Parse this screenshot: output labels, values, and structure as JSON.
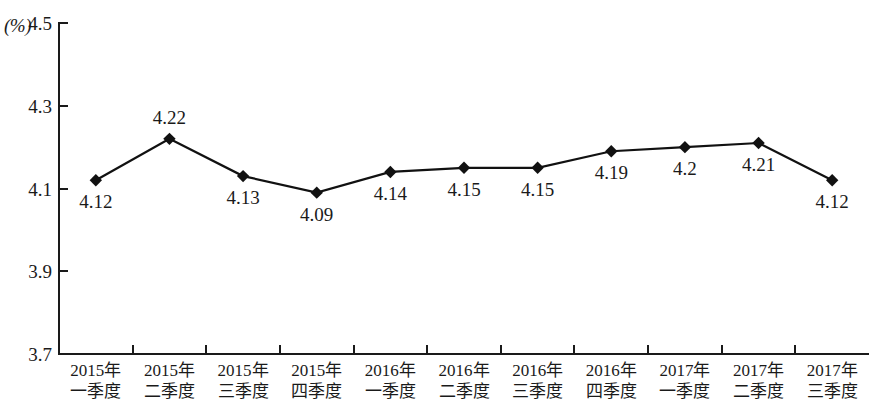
{
  "chart_data": {
    "type": "line",
    "title": "",
    "xlabel": "",
    "ylabel": "",
    "unit_label": "(%)",
    "ylim": [
      3.7,
      4.5
    ],
    "ytick_values": [
      4.5,
      4.3,
      4.1,
      3.9,
      3.7
    ],
    "ytick_labels": [
      "4.5",
      "4.3",
      "4.1",
      "3.9",
      "3.7"
    ],
    "grid": false,
    "legend": false,
    "categories": [
      "2015年一季度",
      "2015年二季度",
      "2015年三季度",
      "2015年四季度",
      "2016年一季度",
      "2016年二季度",
      "2016年三季度",
      "2016年四季度",
      "2017年一季度",
      "2017年二季度",
      "2017年三季度"
    ],
    "category_lines": [
      [
        "2015年",
        "一季度"
      ],
      [
        "2015年",
        "二季度"
      ],
      [
        "2015年",
        "三季度"
      ],
      [
        "2015年",
        "四季度"
      ],
      [
        "2016年",
        "一季度"
      ],
      [
        "2016年",
        "二季度"
      ],
      [
        "2016年",
        "三季度"
      ],
      [
        "2016年",
        "四季度"
      ],
      [
        "2017年",
        "一季度"
      ],
      [
        "2017年",
        "二季度"
      ],
      [
        "2017年",
        "三季度"
      ]
    ],
    "values": [
      4.12,
      4.22,
      4.13,
      4.09,
      4.14,
      4.15,
      4.15,
      4.19,
      4.2,
      4.21,
      4.12
    ],
    "point_labels": [
      "4.12",
      "4.22",
      "4.13",
      "4.09",
      "4.14",
      "4.15",
      "4.15",
      "4.19",
      "4.2",
      "4.21",
      "4.12"
    ],
    "label_positions": [
      "below",
      "above",
      "below",
      "below",
      "below",
      "below",
      "below",
      "below",
      "below",
      "below",
      "below"
    ],
    "marker": "diamond",
    "marker_color": "#111111",
    "line_color": "#111111",
    "axis_color": "#1a1a1a"
  }
}
